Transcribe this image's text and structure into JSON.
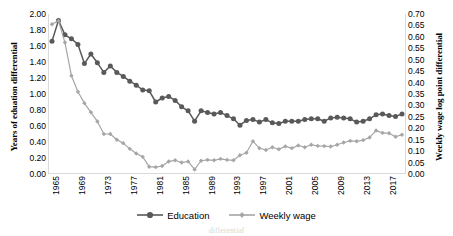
{
  "chart_data": {
    "type": "line",
    "title": "",
    "xlabel": "",
    "ylabel": "Years of eduation differential",
    "y2label": "Weekly wage log point differential",
    "grid": false,
    "legend_position": "bottom-center",
    "ylim": [
      0.0,
      2.0
    ],
    "ytick_step": 0.2,
    "y2lim": [
      0.0,
      0.7
    ],
    "y2tick_step": 0.05,
    "yticks": [
      "0.00",
      "0.20",
      "0.40",
      "0.60",
      "0.80",
      "1.00",
      "1.20",
      "1.40",
      "1.60",
      "1.80",
      "2.00"
    ],
    "y2ticks": [
      "0.00",
      "0.05",
      "0.10",
      "0.15",
      "0.20",
      "0.25",
      "0.30",
      "0.35",
      "0.40",
      "0.45",
      "0.50",
      "0.55",
      "0.60",
      "0.65",
      "0.70"
    ],
    "xticks": [
      "1965",
      "1969",
      "1973",
      "1977",
      "1981",
      "1985",
      "1989",
      "1993",
      "1997",
      "2001",
      "2005",
      "2009",
      "2013",
      "2017"
    ],
    "xlim": [
      1965,
      2019
    ],
    "x": [
      1965,
      1966,
      1967,
      1968,
      1969,
      1970,
      1971,
      1972,
      1973,
      1974,
      1975,
      1976,
      1977,
      1978,
      1979,
      1980,
      1981,
      1982,
      1983,
      1984,
      1985,
      1986,
      1987,
      1988,
      1989,
      1990,
      1991,
      1992,
      1993,
      1994,
      1995,
      1996,
      1997,
      1998,
      1999,
      2000,
      2001,
      2002,
      2003,
      2004,
      2005,
      2006,
      2007,
      2008,
      2009,
      2010,
      2011,
      2012,
      2013,
      2014,
      2015,
      2016,
      2017,
      2018,
      2019
    ],
    "series": [
      {
        "name": "Education",
        "axis": "left",
        "color": "#595959",
        "marker": "circle",
        "values": [
          1.66,
          1.92,
          1.74,
          1.69,
          1.62,
          1.38,
          1.5,
          1.39,
          1.27,
          1.35,
          1.27,
          1.22,
          1.16,
          1.11,
          1.05,
          1.04,
          0.9,
          0.95,
          0.97,
          0.92,
          0.84,
          0.79,
          0.66,
          0.79,
          0.77,
          0.75,
          0.77,
          0.73,
          0.69,
          0.61,
          0.67,
          0.68,
          0.65,
          0.68,
          0.64,
          0.63,
          0.66,
          0.66,
          0.66,
          0.68,
          0.69,
          0.69,
          0.66,
          0.7,
          0.71,
          0.7,
          0.69,
          0.65,
          0.66,
          0.69,
          0.74,
          0.75,
          0.73,
          0.72,
          0.75
        ]
      },
      {
        "name": "Weekly wage",
        "axis": "right",
        "color": "#a6a6a6",
        "marker": "diamond",
        "values": [
          0.655,
          0.67,
          0.575,
          0.43,
          0.36,
          0.31,
          0.27,
          0.23,
          0.175,
          0.175,
          0.15,
          0.135,
          0.11,
          0.09,
          0.075,
          0.032,
          0.03,
          0.035,
          0.055,
          0.06,
          0.05,
          0.055,
          0.02,
          0.058,
          0.062,
          0.06,
          0.066,
          0.062,
          0.06,
          0.082,
          0.093,
          0.143,
          0.113,
          0.105,
          0.117,
          0.108,
          0.121,
          0.113,
          0.125,
          0.117,
          0.128,
          0.123,
          0.122,
          0.12,
          0.128,
          0.138,
          0.145,
          0.143,
          0.148,
          0.16,
          0.19,
          0.18,
          0.178,
          0.163,
          0.172
        ]
      }
    ]
  },
  "legend": {
    "entries": [
      {
        "label": "Education"
      },
      {
        "label": "Weekly wage"
      }
    ]
  },
  "caption": {
    "text": "differential"
  }
}
